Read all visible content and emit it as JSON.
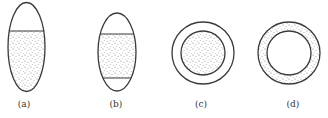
{
  "figure": {
    "panels": [
      {
        "id": "a",
        "label": "(a)",
        "shape": "vertical-ellipse",
        "fill": "stippled lower portion, blank top cap"
      },
      {
        "id": "b",
        "label": "(b)",
        "shape": "vertical-ellipse",
        "fill": "stippled middle band, blank top and bottom caps"
      },
      {
        "id": "c",
        "label": "(c)",
        "shape": "concentric-circles",
        "fill": "stippled inner disc, blank outer ring"
      },
      {
        "id": "d",
        "label": "(d)",
        "shape": "concentric-circles",
        "fill": "stippled outer ring, blank inner disc"
      }
    ],
    "colors": {
      "stroke": "#3a3a3a",
      "dots": "#6a6a6a",
      "background": "#ffffff"
    }
  }
}
